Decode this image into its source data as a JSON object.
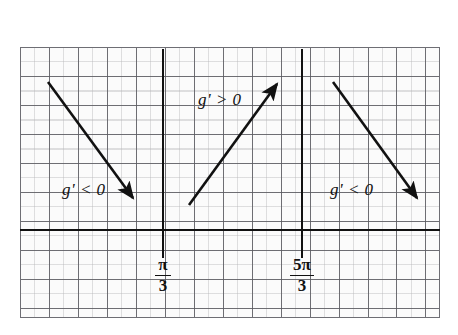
{
  "figure": {
    "type": "sign-chart"
  },
  "grid": {
    "major_spacing_px": 29,
    "minor_spacing_px": 14.5,
    "major_color": "#5a5a60",
    "minor_color": "#787880",
    "frame_color": "#6e6e74",
    "background": "#fbfbfb"
  },
  "axes": {
    "axis_color": "#111111",
    "horizontal": {
      "label": "x-axis",
      "y_px": 230
    },
    "verticals": [
      {
        "label": "pi/3 vertical line",
        "x_px": 163
      },
      {
        "label": "5pi/3 vertical line",
        "x_px": 302
      }
    ]
  },
  "tick_labels": [
    {
      "name": "pi-over-3",
      "numerator": "π",
      "denominator": "3",
      "x_px": 163
    },
    {
      "name": "five-pi-over-3",
      "numerator": "5π",
      "denominator": "3",
      "x_px": 302
    }
  ],
  "annotations": [
    {
      "name": "left-interval",
      "text": "g' < 0",
      "x_px": 62,
      "y_px": 180
    },
    {
      "name": "middle-interval",
      "text": "g' > 0",
      "x_px": 198,
      "y_px": 90
    },
    {
      "name": "right-interval",
      "text": "g' < 0",
      "x_px": 330,
      "y_px": 180
    }
  ],
  "arrows": [
    {
      "name": "arrow-decreasing-left",
      "direction": "down-right",
      "x1": 48,
      "y1": 82,
      "x2": 136,
      "y2": 202
    },
    {
      "name": "arrow-increasing-middle",
      "direction": "up-right",
      "x1": 189,
      "y1": 205,
      "x2": 280,
      "y2": 80
    },
    {
      "name": "arrow-decreasing-right",
      "direction": "down-right",
      "x1": 333,
      "y1": 82,
      "x2": 420,
      "y2": 202
    }
  ]
}
